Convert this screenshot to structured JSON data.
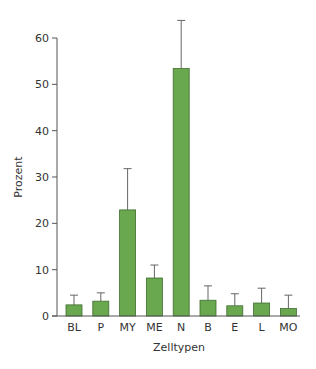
{
  "chart_data": {
    "type": "bar",
    "title": "",
    "xlabel": "Zelltypen",
    "ylabel": "Prozent",
    "ylim": [
      0,
      60
    ],
    "yticks": [
      0,
      10,
      20,
      30,
      40,
      50,
      60
    ],
    "grid": false,
    "legend": null,
    "error_bars": true,
    "categories": [
      "BL",
      "P",
      "MY",
      "ME",
      "N",
      "B",
      "E",
      "L",
      "MO"
    ],
    "values": [
      2.4,
      3.2,
      22.9,
      8.2,
      53.4,
      3.4,
      2.2,
      2.8,
      1.6
    ],
    "error_upper": [
      4.5,
      5.0,
      31.8,
      11.0,
      63.8,
      6.5,
      4.8,
      6.0,
      4.5
    ],
    "colors": {
      "bar_fill": "#6aa84f",
      "bar_stroke": "#3f6d2e",
      "axis": "#555555",
      "text": "#333333"
    }
  }
}
